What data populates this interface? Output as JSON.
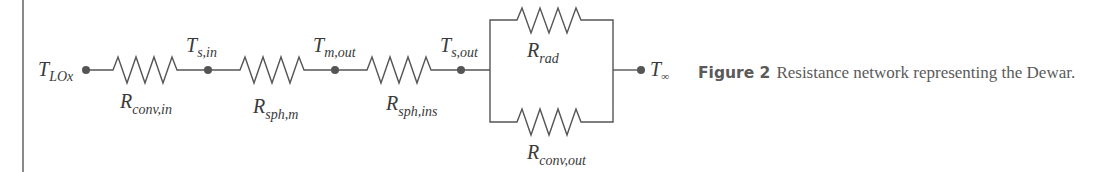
{
  "diagram": {
    "type": "resistance-network",
    "nodes": [
      {
        "id": "T_LOx",
        "main": "T",
        "sub": "LOx"
      },
      {
        "id": "T_s_in",
        "main": "T",
        "sub": "s,in"
      },
      {
        "id": "T_m_out",
        "main": "T",
        "sub": "m,out"
      },
      {
        "id": "T_s_out",
        "main": "T",
        "sub": "s,out"
      },
      {
        "id": "T_inf",
        "main": "T",
        "sub": "∞"
      }
    ],
    "resistors": [
      {
        "id": "R_conv_in",
        "main": "R",
        "sub": "conv,in",
        "from": "T_LOx",
        "to": "T_s_in"
      },
      {
        "id": "R_sph_m",
        "main": "R",
        "sub": "sph,m",
        "from": "T_s_in",
        "to": "T_m_out"
      },
      {
        "id": "R_sph_ins",
        "main": "R",
        "sub": "sph,ins",
        "from": "T_m_out",
        "to": "T_s_out"
      },
      {
        "id": "R_rad",
        "main": "R",
        "sub": "rad",
        "from": "T_s_out",
        "to": "T_inf",
        "arrangement": "parallel-top"
      },
      {
        "id": "R_conv_out",
        "main": "R",
        "sub": "conv,out",
        "from": "T_s_out",
        "to": "T_inf",
        "arrangement": "parallel-bottom"
      }
    ]
  },
  "caption": {
    "label": "Figure 2",
    "text": "Resistance network representing the Dewar."
  },
  "colors": {
    "wire": "#555555",
    "text": "#3a3a3a",
    "caption": "#5a5a5a",
    "frame": "#8a8a8a"
  }
}
